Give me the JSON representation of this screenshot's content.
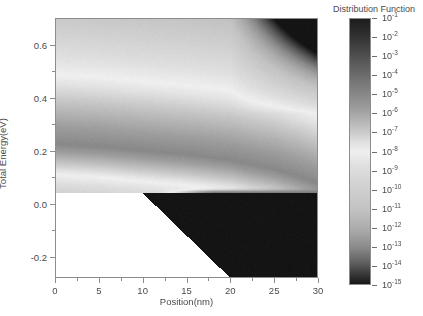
{
  "figure": {
    "kind": "heatmap",
    "background_color": "#ffffff",
    "axis_color": "#8d8d8d",
    "text_color": "#4a4a4a"
  },
  "axes": {
    "x_title": "Position(nm)",
    "y_title": "Total Energy(eV)",
    "x_ticks": [
      0,
      5,
      10,
      15,
      20,
      25,
      30
    ],
    "x_tick_labels": [
      "0",
      "5",
      "10",
      "15",
      "20",
      "25",
      "30"
    ],
    "x_minor_ticks": [
      2.5,
      7.5,
      12.5,
      17.5,
      22.5,
      27.5
    ],
    "y_ticks": [
      -0.2,
      0.0,
      0.2,
      0.4,
      0.6
    ],
    "y_tick_labels": [
      "-0.2",
      "0.0",
      "0.2",
      "0.4",
      "0.6"
    ],
    "y_minor_ticks": [
      -0.1,
      0.1,
      0.3,
      0.5
    ],
    "xlim": [
      0,
      30
    ],
    "ylim": [
      -0.28,
      0.7
    ],
    "grid": false
  },
  "colorbar": {
    "title": "Distribution Function",
    "tick_labels": [
      "10⁻¹",
      "10⁻²",
      "10⁻³",
      "10⁻⁴",
      "10⁻⁵",
      "10⁻⁶",
      "10⁻⁷",
      "10⁻⁸",
      "10⁻⁹",
      "10⁻¹⁰",
      "10⁻¹¹",
      "10⁻¹²",
      "10⁻¹³",
      "10⁻¹⁴",
      "10⁻¹⁵"
    ],
    "tick_exponents": [
      -1,
      -2,
      -3,
      -4,
      -5,
      -6,
      -7,
      -8,
      -9,
      -10,
      -11,
      -12,
      -13,
      -14,
      -15
    ],
    "scale": "log",
    "vmin_exponent": -15,
    "vmax_exponent": -1,
    "orientation": "vertical",
    "position": "right",
    "colormap": "gray-nonmonotonic-dark-light-dark",
    "stops": [
      {
        "pos": 0.0,
        "color": "#1c1c1c"
      },
      {
        "pos": 0.06,
        "color": "#2e2e2e"
      },
      {
        "pos": 0.16,
        "color": "#575757"
      },
      {
        "pos": 0.26,
        "color": "#7e7e7e"
      },
      {
        "pos": 0.34,
        "color": "#9d9d9d"
      },
      {
        "pos": 0.42,
        "color": "#c6c6c6"
      },
      {
        "pos": 0.47,
        "color": "#e2e2e2"
      },
      {
        "pos": 0.5,
        "color": "#efefef"
      },
      {
        "pos": 0.56,
        "color": "#dedede"
      },
      {
        "pos": 0.64,
        "color": "#cfcfcf"
      },
      {
        "pos": 0.72,
        "color": "#c2c2c2"
      },
      {
        "pos": 0.8,
        "color": "#a8a8a8"
      },
      {
        "pos": 0.86,
        "color": "#8a8a8a"
      },
      {
        "pos": 0.92,
        "color": "#5e5e5e"
      },
      {
        "pos": 0.97,
        "color": "#303030"
      },
      {
        "pos": 1.0,
        "color": "#141414"
      }
    ]
  },
  "chart_data": {
    "type": "heatmap",
    "title": "",
    "xlabel": "Position(nm)",
    "ylabel": "Total Energy(eV)",
    "xlim": [
      0,
      30
    ],
    "ylim": [
      -0.28,
      0.7
    ],
    "value_label": "Distribution Function",
    "value_scale": "log10",
    "value_range_exponent": [
      -15,
      -1
    ],
    "grid": false,
    "blank_region": {
      "description": "white (no-data) region below the classical turning point in the lower-left",
      "vertices_nm_eV": [
        [
          0,
          0.04
        ],
        [
          10,
          0.04
        ],
        [
          20,
          -0.28
        ],
        [
          0,
          -0.28
        ]
      ]
    },
    "features": [
      {
        "name": "source-side thermal distribution",
        "description": "broad gray field filling energies above 0.04 eV on the source (left) side, gradually darkening toward high energy",
        "x_range_nm": [
          0,
          30
        ],
        "y_range_eV": [
          0.04,
          0.7
        ]
      },
      {
        "name": "upper bright ridge (source injection peak)",
        "description": "light band near 0.22 eV at x=0 that slopes gently downward toward 0.10 eV near x=28",
        "points_nm_eV": [
          [
            0,
            0.225
          ],
          [
            5,
            0.215
          ],
          [
            10,
            0.2
          ],
          [
            15,
            0.185
          ],
          [
            20,
            0.165
          ],
          [
            25,
            0.13
          ],
          [
            28,
            0.1
          ]
        ]
      },
      {
        "name": "band-edge bright line",
        "description": "thin bright horizontal line right at 0.04 eV extending from about x=13 to x=30",
        "y_eV": 0.04,
        "x_range_nm": [
          13,
          30
        ]
      },
      {
        "name": "lower bright band (drain-side hot carriers)",
        "description": "broad light band centered near -0.10 eV on the drain side, from about x=12 to x=30",
        "y_eV": -0.1,
        "x_range_nm": [
          12,
          30
        ]
      },
      {
        "name": "dark top-right corner",
        "description": "strong darkening at high energy on the drain side above roughly 0.45 eV for x>25",
        "x_range_nm": [
          25,
          30
        ],
        "y_range_eV": [
          0.45,
          0.7
        ]
      },
      {
        "name": "dark band just above band edge",
        "description": "dark horizontal band between 0.04 and 0.12 eV on the source side (x<20)",
        "x_range_nm": [
          0,
          20
        ],
        "y_range_eV": [
          0.04,
          0.12
        ]
      },
      {
        "name": "dark low-energy region",
        "description": "darkening below about -0.18 eV on the drain side",
        "x_range_nm": [
          18,
          30
        ],
        "y_range_eV": [
          -0.28,
          -0.18
        ]
      }
    ]
  }
}
